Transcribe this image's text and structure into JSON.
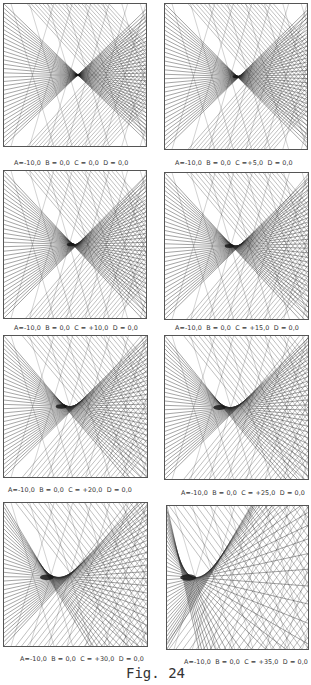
{
  "figure": {
    "caption": "Fig. 24",
    "panels": [
      {
        "id": "p1",
        "label": "A=-10,0  B = 0,0  C = 0,0  D = 0,0",
        "params": {
          "A": -10.0,
          "B": 0.0,
          "C": 0.0,
          "D": 0.0
        },
        "box": {
          "x": 3,
          "y": 3,
          "w": 142,
          "h": 142
        },
        "label_pos": {
          "x": 14,
          "y": 159
        },
        "focus": {
          "x": 0.52,
          "y": 0.5
        },
        "spread": 0.0
      },
      {
        "id": "p2",
        "label": "A=-10,0  B = 0,0  C =+5,0  D = 0,0",
        "params": {
          "A": -10.0,
          "B": 0.0,
          "C": 5.0,
          "D": 0.0
        },
        "box": {
          "x": 164,
          "y": 3,
          "w": 142,
          "h": 145
        },
        "label_pos": {
          "x": 175,
          "y": 159
        },
        "focus": {
          "x": 0.5,
          "y": 0.5
        },
        "spread": 0.05
      },
      {
        "id": "p3",
        "label": "A=-10,0  B = 0,0  C = +10,0  D = 0,0",
        "params": {
          "A": -10.0,
          "B": 0.0,
          "C": 10.0,
          "D": 0.0
        },
        "box": {
          "x": 3,
          "y": 170,
          "w": 142,
          "h": 147
        },
        "label_pos": {
          "x": 14,
          "y": 324
        },
        "focus": {
          "x": 0.47,
          "y": 0.5
        },
        "spread": 0.1
      },
      {
        "id": "p4",
        "label": "A=-10,0  B = 0,0  C = +15,0  D = 0,0",
        "params": {
          "A": -10.0,
          "B": 0.0,
          "C": 15.0,
          "D": 0.0
        },
        "box": {
          "x": 164,
          "y": 172,
          "w": 143,
          "h": 146
        },
        "label_pos": {
          "x": 175,
          "y": 324
        },
        "focus": {
          "x": 0.45,
          "y": 0.5
        },
        "spread": 0.15
      },
      {
        "id": "p5",
        "label": "A=-10,0  B = 0,0  C = +20,0  D = 0,0",
        "params": {
          "A": -10.0,
          "B": 0.0,
          "C": 20.0,
          "D": 0.0
        },
        "box": {
          "x": 3,
          "y": 335,
          "w": 143,
          "h": 141
        },
        "label_pos": {
          "x": 8,
          "y": 486
        },
        "focus": {
          "x": 0.4,
          "y": 0.5
        },
        "spread": 0.22
      },
      {
        "id": "p6",
        "label": "A=-10,0  B = 0,0  C = +25,0  D = 0,0",
        "params": {
          "A": -10.0,
          "B": 0.0,
          "C": 25.0,
          "D": 0.0
        },
        "box": {
          "x": 164,
          "y": 335,
          "w": 143,
          "h": 143
        },
        "label_pos": {
          "x": 181,
          "y": 489
        },
        "focus": {
          "x": 0.38,
          "y": 0.5
        },
        "spread": 0.28
      },
      {
        "id": "p7",
        "label": "A=-10,0  B = 0,0  C = +30,0  D = 0,0",
        "params": {
          "A": -10.0,
          "B": 0.0,
          "C": 30.0,
          "D": 0.0
        },
        "box": {
          "x": 3,
          "y": 502,
          "w": 143,
          "h": 143
        },
        "label_pos": {
          "x": 20,
          "y": 655
        },
        "focus": {
          "x": 0.3,
          "y": 0.52
        },
        "spread": 0.36
      },
      {
        "id": "p8",
        "label": "A=-10,0  B = 0,0  C = +35,0  D = 0,0",
        "params": {
          "A": -10.0,
          "B": 0.0,
          "C": 35.0,
          "D": 0.0
        },
        "box": {
          "x": 166,
          "y": 505,
          "w": 141,
          "h": 143
        },
        "label_pos": {
          "x": 184,
          "y": 658
        },
        "focus": {
          "x": 0.15,
          "y": 0.5
        },
        "spread": 0.45
      }
    ]
  },
  "colors": {
    "line": "#2a2a2a",
    "border": "#555555",
    "background": "#ffffff"
  }
}
